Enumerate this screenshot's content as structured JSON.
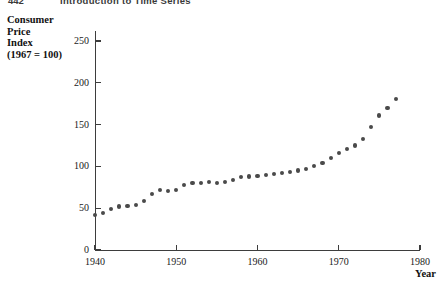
{
  "running_head": {
    "page_number": "442",
    "title": "Introduction to Time Series"
  },
  "chart_data": {
    "type": "scatter",
    "title": "",
    "ylabel": "Consumer\nPrice\nIndex\n(1967 = 100)",
    "xlabel": "Year",
    "xlim": [
      1940,
      1980
    ],
    "ylim": [
      0,
      262
    ],
    "grid": false,
    "legend": null,
    "marker_color": "#4a4a4a",
    "axis_color": "#3d3d3d",
    "xticks": [
      1940,
      1950,
      1960,
      1970,
      1980
    ],
    "xtick_labels": [
      "1940",
      "1950",
      "1960",
      "1970",
      "1980"
    ],
    "yticks": [
      0,
      50,
      100,
      150,
      200,
      250
    ],
    "ytick_labels": [
      "0",
      "50",
      "100",
      "150",
      "200",
      "250"
    ],
    "x": [
      1940,
      1941,
      1942,
      1943,
      1944,
      1945,
      1946,
      1947,
      1948,
      1949,
      1950,
      1951,
      1952,
      1953,
      1954,
      1955,
      1956,
      1957,
      1958,
      1959,
      1960,
      1961,
      1962,
      1963,
      1964,
      1965,
      1966,
      1967,
      1968,
      1969,
      1970,
      1971,
      1972,
      1973,
      1974,
      1975,
      1976,
      1977
    ],
    "values": [
      42,
      44,
      49,
      52,
      53,
      54,
      59,
      67,
      72,
      71,
      72,
      78,
      80,
      80,
      81,
      80,
      81,
      84,
      87,
      88,
      89,
      90,
      91,
      92,
      93,
      95,
      97,
      100,
      104,
      110,
      116,
      121,
      125,
      133,
      147,
      161,
      170,
      181
    ]
  }
}
